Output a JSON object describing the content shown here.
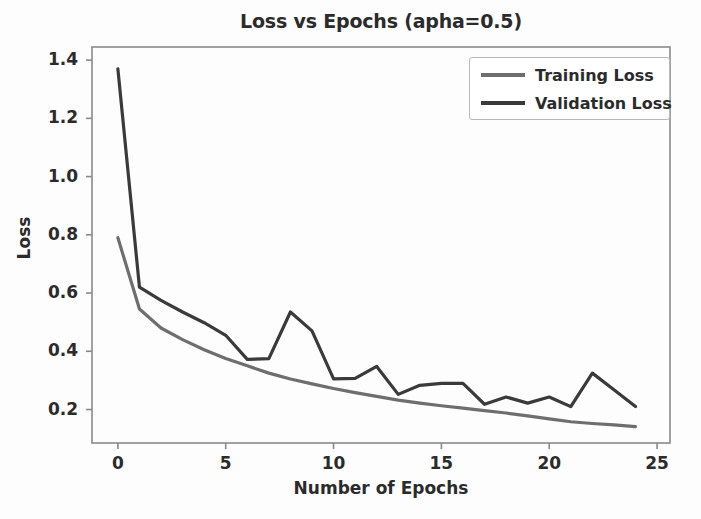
{
  "chart_data": {
    "type": "line",
    "title": "Loss vs Epochs (apha=0.5)",
    "xlabel": "Number of Epochs",
    "ylabel": "Loss",
    "xlim": [
      -1.2,
      25.6
    ],
    "ylim": [
      0.085,
      1.445
    ],
    "xticks": [
      0,
      5,
      10,
      15,
      20,
      25
    ],
    "xtick_labels": [
      "0",
      "5",
      "10",
      "15",
      "20",
      "25"
    ],
    "yticks": [
      0.2,
      0.4,
      0.6,
      0.8,
      1.0,
      1.2,
      1.4
    ],
    "ytick_labels": [
      "0.2",
      "0.4",
      "0.6",
      "0.8",
      "1.0",
      "1.2",
      "1.4"
    ],
    "grid": false,
    "legend_position": "upper right",
    "x": [
      0,
      1,
      2,
      3,
      4,
      5,
      6,
      7,
      8,
      9,
      10,
      11,
      12,
      13,
      14,
      15,
      16,
      17,
      18,
      19,
      20,
      21,
      22,
      23,
      24
    ],
    "series": [
      {
        "name": "Training Loss",
        "color": "#6e6e6e",
        "linewidth": 3.2,
        "values": [
          0.79,
          0.545,
          0.48,
          0.44,
          0.405,
          0.375,
          0.35,
          0.325,
          0.305,
          0.288,
          0.272,
          0.258,
          0.245,
          0.232,
          0.222,
          0.213,
          0.205,
          0.196,
          0.188,
          0.178,
          0.168,
          0.158,
          0.152,
          0.147,
          0.141
        ]
      },
      {
        "name": "Validation Loss",
        "color": "#3a3a3a",
        "linewidth": 3.2,
        "values": [
          1.37,
          0.62,
          0.575,
          0.535,
          0.498,
          0.455,
          0.372,
          0.375,
          0.535,
          0.47,
          0.305,
          0.307,
          0.348,
          0.252,
          0.283,
          0.29,
          0.29,
          0.218,
          0.243,
          0.222,
          0.243,
          0.21,
          0.325,
          0.268,
          0.21
        ]
      }
    ]
  },
  "legend": {
    "entries": [
      {
        "label": "Training Loss"
      },
      {
        "label": "Validation Loss"
      }
    ]
  }
}
